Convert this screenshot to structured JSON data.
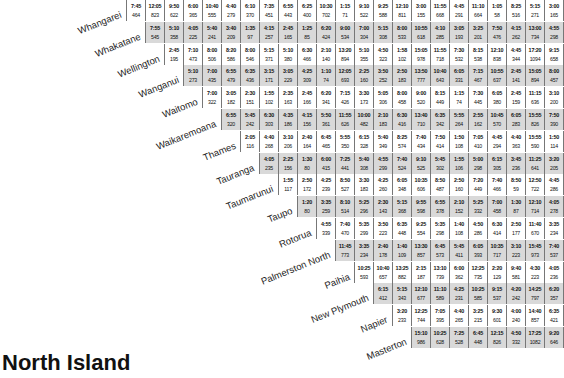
{
  "title": "North Island",
  "rows": [
    {
      "name": "Whangarei",
      "cells": [
        [
          "7:45",
          "464"
        ],
        [
          "12:05",
          "823"
        ],
        [
          "9:50",
          "622"
        ],
        [
          "6:00",
          "365"
        ],
        [
          "10:40",
          "555"
        ],
        [
          "4:40",
          "279"
        ],
        [
          "6:10",
          "370"
        ],
        [
          "7:35",
          "451"
        ],
        [
          "6:55",
          "443"
        ],
        [
          "6:25",
          "400"
        ],
        [
          "10:30",
          "702"
        ],
        [
          "1:15",
          "71"
        ],
        [
          "9:10",
          "522"
        ],
        [
          "9:25",
          "588"
        ],
        [
          "12:10",
          "811"
        ],
        [
          "3:00",
          "155"
        ],
        [
          "11:55",
          "668"
        ],
        [
          "4:45",
          "291"
        ],
        [
          "11:10",
          "664"
        ],
        [
          "1:05",
          "58"
        ],
        [
          "8:25",
          "516"
        ],
        [
          "5:15",
          "271"
        ],
        [
          "3:00",
          "165"
        ]
      ]
    },
    {
      "name": "Whakatane",
      "cells": [
        [
          "7:55",
          "545"
        ],
        [
          "5:10",
          "358"
        ],
        [
          "4:05",
          "225"
        ],
        [
          "5:40",
          "241"
        ],
        [
          "3:40",
          "209"
        ],
        [
          "1:35",
          "97"
        ],
        [
          "4:15",
          "257"
        ],
        [
          "2:45",
          "165"
        ],
        [
          "1:25",
          "85"
        ],
        [
          "6:20",
          "424"
        ],
        [
          "9:00",
          "534"
        ],
        [
          "7:00",
          "304"
        ],
        [
          "5:15",
          "308"
        ],
        [
          "8:00",
          "533"
        ],
        [
          "10:55",
          "618"
        ],
        [
          "4:10",
          "285"
        ],
        [
          "3:05",
          "193"
        ],
        [
          "3:25",
          "201"
        ],
        [
          "7:50",
          "476"
        ],
        [
          "4:15",
          "262"
        ],
        [
          "13:00",
          "734"
        ],
        [
          "4:55",
          "298"
        ]
      ]
    },
    {
      "name": "Wellington",
      "cells": [
        [
          "2:45",
          "195"
        ],
        [
          "7:10",
          "473"
        ],
        [
          "8:00",
          "506"
        ],
        [
          "8:20",
          "586"
        ],
        [
          "8:00",
          "546"
        ],
        [
          "5:15",
          "371"
        ],
        [
          "5:10",
          "380"
        ],
        [
          "6:30",
          "466"
        ],
        [
          "2:10",
          "140"
        ],
        [
          "13:20",
          "894"
        ],
        [
          "5:10",
          "355"
        ],
        [
          "4:50",
          "323"
        ],
        [
          "1:58",
          "102"
        ],
        [
          "15:05",
          "978"
        ],
        [
          "11:55",
          "718"
        ],
        [
          "7:30",
          "532"
        ],
        [
          "8:15",
          "538"
        ],
        [
          "12:10",
          "838"
        ],
        [
          "4:45",
          "344"
        ],
        [
          "17:20",
          "1094"
        ],
        [
          "9:15",
          "658"
        ]
      ]
    },
    {
      "name": "Wanganui",
      "cells": [
        [
          "5:10",
          "273"
        ],
        [
          "7:00",
          "435"
        ],
        [
          "6:55",
          "479"
        ],
        [
          "6:35",
          "436"
        ],
        [
          "3:15",
          "171"
        ],
        [
          "3:05",
          "229"
        ],
        [
          "4:25",
          "309"
        ],
        [
          "1:10",
          "74"
        ],
        [
          "12:05",
          "693"
        ],
        [
          "2:25",
          "160"
        ],
        [
          "3:50",
          "252"
        ],
        [
          "2:50",
          "183"
        ],
        [
          "13:50",
          "777"
        ],
        [
          "10:40",
          "643"
        ],
        [
          "6:05",
          "331"
        ],
        [
          "7:15",
          "467"
        ],
        [
          "10:55",
          "637"
        ],
        [
          "2:45",
          "141"
        ],
        [
          "15:05",
          "894"
        ],
        [
          "8:00",
          "457"
        ]
      ]
    },
    {
      "name": "Waitomo",
      "cells": [
        [
          "7:00",
          "322"
        ],
        [
          "3:05",
          "182"
        ],
        [
          "2:30",
          "151"
        ],
        [
          "1:55",
          "102"
        ],
        [
          "2:35",
          "163"
        ],
        [
          "2:45",
          "166"
        ],
        [
          "6:20",
          "341"
        ],
        [
          "7:15",
          "426"
        ],
        [
          "3:30",
          "173"
        ],
        [
          "5:05",
          "306"
        ],
        [
          "8:00",
          "458"
        ],
        [
          "9:00",
          "520"
        ],
        [
          "8:15",
          "449"
        ],
        [
          "1:15",
          "74"
        ],
        [
          "7:30",
          "445"
        ],
        [
          "6:05",
          "380"
        ],
        [
          "2:45",
          "159"
        ],
        [
          "11:15",
          "636"
        ],
        [
          "3:10",
          "200"
        ]
      ]
    },
    {
      "name": "Waikaremoana",
      "cells": [
        [
          "6:55",
          "320"
        ],
        [
          "5:45",
          "242"
        ],
        [
          "6:30",
          "303"
        ],
        [
          "4:35",
          "186"
        ],
        [
          "4:15",
          "156"
        ],
        [
          "5:50",
          "361"
        ],
        [
          "11:55",
          "626"
        ],
        [
          "10:00",
          "482"
        ],
        [
          "2:10",
          "183"
        ],
        [
          "6:30",
          "416"
        ],
        [
          "13:40",
          "710"
        ],
        [
          "6:35",
          "342"
        ],
        [
          "5:55",
          "264"
        ],
        [
          "2:55",
          "162"
        ],
        [
          "10:45",
          "570"
        ],
        [
          "6:05",
          "283"
        ],
        [
          "15:55",
          "826"
        ],
        [
          "7:50",
          "390"
        ]
      ]
    },
    {
      "name": "Thames",
      "cells": [
        [
          "2:05",
          "116"
        ],
        [
          "4:40",
          "268"
        ],
        [
          "3:10",
          "206"
        ],
        [
          "2:40",
          "164"
        ],
        [
          "6:45",
          "465"
        ],
        [
          "5:55",
          "350"
        ],
        [
          "6:15",
          "328"
        ],
        [
          "5:40",
          "349"
        ],
        [
          "8:25",
          "574"
        ],
        [
          "7:40",
          "434"
        ],
        [
          "7:50",
          "414"
        ],
        [
          "1:50",
          "108"
        ],
        [
          "7:05",
          "410"
        ],
        [
          "4:45",
          "294"
        ],
        [
          "4:40",
          "363"
        ],
        [
          "15:55",
          "590"
        ],
        [
          "1:50",
          "114"
        ]
      ]
    },
    {
      "name": "Tauranga",
      "cells": [
        [
          "4:05",
          "235"
        ],
        [
          "2:25",
          "156"
        ],
        [
          "1:30",
          "80"
        ],
        [
          "6:00",
          "415"
        ],
        [
          "7:25",
          "441"
        ],
        [
          "5:40",
          "308"
        ],
        [
          "4:55",
          "299"
        ],
        [
          "7:40",
          "524"
        ],
        [
          "9:10",
          "525"
        ],
        [
          "5:45",
          "302"
        ],
        [
          "1:55",
          "106"
        ],
        [
          "5:00",
          "298"
        ],
        [
          "6:15",
          "305"
        ],
        [
          "3:45",
          "236"
        ],
        [
          "11:25",
          "641"
        ],
        [
          "3:20",
          "205"
        ]
      ]
    },
    {
      "name": "Taumarunui",
      "cells": [
        [
          "1:55",
          "117"
        ],
        [
          "2:50",
          "172"
        ],
        [
          "4:25",
          "239"
        ],
        [
          "8:50",
          "527"
        ],
        [
          "3:30",
          "183"
        ],
        [
          "4:25",
          "260"
        ],
        [
          "6:05",
          "348"
        ],
        [
          "10:35",
          "606"
        ],
        [
          "8:50",
          "487"
        ],
        [
          "2:50",
          "160"
        ],
        [
          "7:20",
          "449"
        ],
        [
          "7:40",
          "466"
        ],
        [
          "8:50",
          "59"
        ],
        [
          "12:50",
          "722"
        ],
        [
          "4:45",
          "286"
        ]
      ]
    },
    {
      "name": "Taupo",
      "cells": [
        [
          "1:20",
          "80"
        ],
        [
          "3:35",
          "259"
        ],
        [
          "8:10",
          "514"
        ],
        [
          "5:25",
          "296"
        ],
        [
          "2:30",
          "143"
        ],
        [
          "5:15",
          "368"
        ],
        [
          "9:55",
          "598"
        ],
        [
          "6:55",
          "378"
        ],
        [
          "2:10",
          "152"
        ],
        [
          "5:25",
          "332"
        ],
        [
          "7:00",
          "458"
        ],
        [
          "1:30",
          "87"
        ],
        [
          "12:10",
          "714"
        ],
        [
          "4:05",
          "278"
        ]
      ]
    },
    {
      "name": "Rotorua",
      "cells": [
        [
          "4:55",
          "339"
        ],
        [
          "7:40",
          "470"
        ],
        [
          "5:35",
          "299"
        ],
        [
          "3:50",
          "223"
        ],
        [
          "6:35",
          "448"
        ],
        [
          "9:25",
          "554"
        ],
        [
          "5:35",
          "298"
        ],
        [
          "1:40",
          "108"
        ],
        [
          "4:50",
          "286"
        ],
        [
          "6:30",
          "414"
        ],
        [
          "2:50",
          "177"
        ],
        [
          "11:40",
          "670"
        ],
        [
          "3:35",
          "234"
        ]
      ]
    },
    {
      "name": "Palmerston North",
      "cells": [
        [
          "11:45",
          "773"
        ],
        [
          "3:35",
          "234"
        ],
        [
          "2:40",
          "178"
        ],
        [
          "1:40",
          "109"
        ],
        [
          "13:30",
          "857"
        ],
        [
          "6:45",
          "573"
        ],
        [
          "5:45",
          "411"
        ],
        [
          "6:05",
          "393"
        ],
        [
          "10:35",
          "717"
        ],
        [
          "3:10",
          "223"
        ],
        [
          "15:45",
          "973"
        ],
        [
          "7:40",
          "537"
        ]
      ]
    },
    {
      "name": "Paihia",
      "cells": [
        [
          "10:25",
          "593"
        ],
        [
          "10:40",
          "657"
        ],
        [
          "13:25",
          "882"
        ],
        [
          "2:15",
          "187"
        ],
        [
          "13:10",
          "739"
        ],
        [
          "6:00",
          "362"
        ],
        [
          "12:25",
          "735"
        ],
        [
          "2:20",
          "129"
        ],
        [
          "9:40",
          "581"
        ],
        [
          "4:30",
          "223"
        ],
        [
          "4:05",
          "236"
        ]
      ]
    },
    {
      "name": "New Plymouth",
      "cells": [
        [
          "6:15",
          "412"
        ],
        [
          "5:15",
          "343"
        ],
        [
          "12:10",
          "677"
        ],
        [
          "11:10",
          "589"
        ],
        [
          "4:25",
          "231"
        ],
        [
          "10:25",
          "585"
        ],
        [
          "9:15",
          "537"
        ],
        [
          "4:20",
          "242"
        ],
        [
          "14:25",
          "797"
        ],
        [
          "6:20",
          "357"
        ]
      ]
    },
    {
      "name": "Napier",
      "cells": [
        [
          "3:20",
          "233"
        ],
        [
          "12:25",
          "744"
        ],
        [
          "7:05",
          "395"
        ],
        [
          "4:40",
          "265"
        ],
        [
          "3:25",
          "215"
        ],
        [
          "9:30",
          "601"
        ],
        [
          "4:00",
          "240"
        ],
        [
          "14:40",
          "857"
        ],
        [
          "6:35",
          "421"
        ]
      ]
    },
    {
      "name": "Masterton",
      "cells": [
        [
          "15:10",
          "986"
        ],
        [
          "10:25",
          "628"
        ],
        [
          "7:25",
          "528"
        ],
        [
          "6:45",
          "448"
        ],
        [
          "12:15",
          "826"
        ],
        [
          "4:50",
          "332"
        ],
        [
          "17:25",
          "1082"
        ],
        [
          "9:20",
          "646"
        ]
      ]
    }
  ]
}
